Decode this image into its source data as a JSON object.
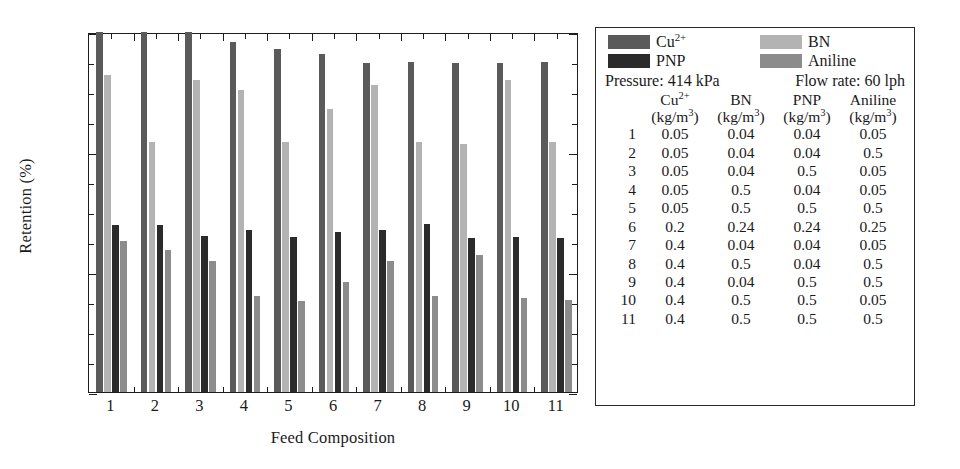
{
  "chart_data": {
    "type": "bar",
    "title": "",
    "xlabel": "Feed Composition",
    "ylabel": "Retention (%)",
    "ylim": [
      85,
      100
    ],
    "yticks": [
      85,
      90,
      95,
      100
    ],
    "yminor_step": 1.25,
    "grid": false,
    "legend_position": "right-panel",
    "categories": [
      "1",
      "2",
      "3",
      "4",
      "5",
      "6",
      "7",
      "8",
      "9",
      "10",
      "11"
    ],
    "series": [
      {
        "name": "Cu2+",
        "label": "Cu2+",
        "color": "#5a5a5a",
        "values": [
          100.0,
          100.0,
          100.0,
          99.6,
          99.3,
          99.1,
          98.7,
          98.75,
          98.7,
          98.7,
          98.75
        ]
      },
      {
        "name": "BN",
        "label": "BN",
        "color": "#b3b3b3",
        "values": [
          98.2,
          95.4,
          98.0,
          97.6,
          95.4,
          96.8,
          97.8,
          95.4,
          95.35,
          98.0,
          95.4
        ]
      },
      {
        "name": "PNP",
        "label": "PNP",
        "color": "#2b2b2b",
        "values": [
          91.95,
          91.95,
          91.5,
          91.75,
          91.45,
          91.65,
          91.75,
          92.0,
          91.4,
          91.45,
          91.4
        ]
      },
      {
        "name": "Aniline",
        "label": "Aniline",
        "color": "#8c8c8c",
        "values": [
          91.3,
          90.9,
          90.45,
          89.0,
          88.8,
          89.6,
          90.45,
          89.0,
          90.7,
          88.9,
          88.85
        ]
      }
    ]
  },
  "legend": {
    "entries": [
      {
        "label": "Cu",
        "sup": "2+",
        "color": "#5a5a5a",
        "name": "cu"
      },
      {
        "label": "BN",
        "sup": "",
        "color": "#b3b3b3",
        "name": "bn"
      },
      {
        "label": "PNP",
        "sup": "",
        "color": "#2b2b2b",
        "name": "pnp"
      },
      {
        "label": "Aniline",
        "sup": "",
        "color": "#8c8c8c",
        "name": "aniline"
      }
    ],
    "cu_label": "Cu",
    "cu_sup": "2+",
    "bn_label": "BN",
    "pnp_label": "PNP",
    "aniline_label": "Aniline"
  },
  "conditions": {
    "pressure": "Pressure: 414 kPa",
    "flow_rate": "Flow rate: 60 lph"
  },
  "table": {
    "headers": [
      {
        "name": "",
        "unit": ""
      },
      {
        "name": "Cu",
        "sup": "2+",
        "unit": "(kg/m3)"
      },
      {
        "name": "BN",
        "sup": "",
        "unit": "(kg/m3)"
      },
      {
        "name": "PNP",
        "sup": "",
        "unit": "(kg/m3)"
      },
      {
        "name": "Aniline",
        "sup": "",
        "unit": "(kg/m3)"
      }
    ],
    "header_cu": "Cu",
    "header_cu_sup": "2+",
    "header_bn": "BN",
    "header_pnp": "PNP",
    "header_aniline": "Aniline",
    "unit_prefix": "(kg/m",
    "unit_sup": "3",
    "unit_suffix": ")",
    "rows": [
      {
        "idx": "1",
        "cu": "0.05",
        "bn": "0.04",
        "pnp": "0.04",
        "aniline": "0.05"
      },
      {
        "idx": "2",
        "cu": "0.05",
        "bn": "0.04",
        "pnp": "0.04",
        "aniline": "0.5"
      },
      {
        "idx": "3",
        "cu": "0.05",
        "bn": "0.04",
        "pnp": "0.5",
        "aniline": "0.05"
      },
      {
        "idx": "4",
        "cu": "0.05",
        "bn": "0.5",
        "pnp": "0.04",
        "aniline": "0.05"
      },
      {
        "idx": "5",
        "cu": "0.05",
        "bn": "0.5",
        "pnp": "0.5",
        "aniline": "0.5"
      },
      {
        "idx": "6",
        "cu": "0.2",
        "bn": "0.24",
        "pnp": "0.24",
        "aniline": "0.25"
      },
      {
        "idx": "7",
        "cu": "0.4",
        "bn": "0.04",
        "pnp": "0.04",
        "aniline": "0.05"
      },
      {
        "idx": "8",
        "cu": "0.4",
        "bn": "0.5",
        "pnp": "0.04",
        "aniline": "0.5"
      },
      {
        "idx": "9",
        "cu": "0.4",
        "bn": "0.04",
        "pnp": "0.5",
        "aniline": "0.5"
      },
      {
        "idx": "10",
        "cu": "0.4",
        "bn": "0.5",
        "pnp": "0.5",
        "aniline": "0.05"
      },
      {
        "idx": "11",
        "cu": "0.4",
        "bn": "0.5",
        "pnp": "0.5",
        "aniline": "0.5"
      }
    ]
  }
}
